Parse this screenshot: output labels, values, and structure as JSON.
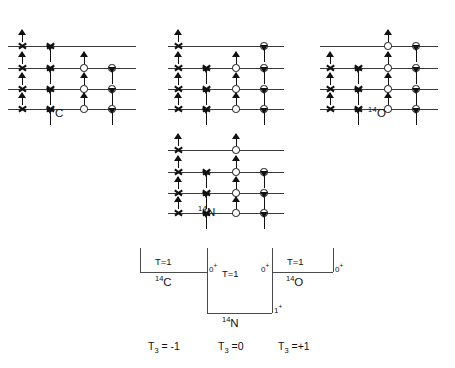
{
  "figure": {
    "top_cut_text": "",
    "caption": ""
  },
  "shell_diagrams": [
    {
      "id": "c14",
      "label_mass": "14",
      "label_symbol": "C",
      "x": 8,
      "y": 16,
      "width": 140,
      "line_width": 128,
      "label_x": 46,
      "label_y": 105,
      "levels": [
        30,
        52,
        73,
        93
      ],
      "columns": {
        "proton_up": 14,
        "proton_down": 42,
        "neutron_up": 76,
        "neutron_down": 104
      },
      "occupancy": [
        {
          "level": 0,
          "proton_up": true,
          "proton_down": true,
          "neutron_up": false,
          "neutron_down": false
        },
        {
          "level": 1,
          "proton_up": true,
          "proton_down": true,
          "neutron_up": true,
          "neutron_down": true
        },
        {
          "level": 2,
          "proton_up": true,
          "proton_down": true,
          "neutron_up": true,
          "neutron_down": true
        },
        {
          "level": 3,
          "proton_up": true,
          "proton_down": true,
          "neutron_up": true,
          "neutron_down": true
        }
      ]
    },
    {
      "id": "middle-top",
      "label_mass": "",
      "label_symbol": "",
      "x": 168,
      "y": 16,
      "width": 128,
      "line_width": 116,
      "label_x": 0,
      "label_y": 0,
      "levels": [
        30,
        52,
        73,
        93
      ],
      "columns": {
        "proton_up": 10,
        "proton_down": 38,
        "neutron_up": 68,
        "neutron_down": 96
      },
      "occupancy": [
        {
          "level": 0,
          "proton_up": true,
          "proton_down": false,
          "neutron_up": false,
          "neutron_down": true
        },
        {
          "level": 1,
          "proton_up": true,
          "proton_down": true,
          "neutron_up": true,
          "neutron_down": true
        },
        {
          "level": 2,
          "proton_up": true,
          "proton_down": true,
          "neutron_up": true,
          "neutron_down": true
        },
        {
          "level": 3,
          "proton_up": true,
          "proton_down": true,
          "neutron_up": true,
          "neutron_down": true
        }
      ]
    },
    {
      "id": "o14",
      "label_mass": "14",
      "label_symbol": "O",
      "x": 320,
      "y": 16,
      "width": 130,
      "line_width": 118,
      "label_x": 368,
      "label_y": 105,
      "levels": [
        30,
        52,
        73,
        93
      ],
      "columns": {
        "proton_up": 10,
        "proton_down": 38,
        "neutron_up": 68,
        "neutron_down": 96
      },
      "occupancy": [
        {
          "level": 0,
          "proton_up": false,
          "proton_down": false,
          "neutron_up": true,
          "neutron_down": true
        },
        {
          "level": 1,
          "proton_up": true,
          "proton_down": true,
          "neutron_up": true,
          "neutron_down": true
        },
        {
          "level": 2,
          "proton_up": true,
          "proton_down": true,
          "neutron_up": true,
          "neutron_down": true
        },
        {
          "level": 3,
          "proton_up": true,
          "proton_down": true,
          "neutron_up": true,
          "neutron_down": true
        }
      ]
    },
    {
      "id": "n14",
      "label_mass": "14",
      "label_symbol": "N",
      "x": 168,
      "y": 120,
      "width": 128,
      "line_width": 116,
      "label_x": 198,
      "label_y": 204,
      "levels": [
        30,
        52,
        73,
        93
      ],
      "columns": {
        "proton_up": 10,
        "proton_down": 38,
        "neutron_up": 68,
        "neutron_down": 96
      },
      "occupancy": [
        {
          "level": 0,
          "proton_up": true,
          "proton_down": false,
          "neutron_up": true,
          "neutron_down": false
        },
        {
          "level": 1,
          "proton_up": true,
          "proton_down": true,
          "neutron_up": true,
          "neutron_down": true
        },
        {
          "level": 2,
          "proton_up": true,
          "proton_down": true,
          "neutron_up": true,
          "neutron_down": true
        },
        {
          "level": 3,
          "proton_up": true,
          "proton_down": true,
          "neutron_up": true,
          "neutron_down": true
        }
      ]
    }
  ],
  "isospin_diagram": {
    "wells": [
      {
        "id": "c14",
        "label_mass": "14",
        "label_symbol": "C",
        "isospin": "T=1",
        "jp_value": "0",
        "jp_sign": "+",
        "left": 140,
        "right": 207,
        "top": 248,
        "bottom": 272,
        "label_x": 155,
        "label_y": 274,
        "isospin_x": 155,
        "isospin_y": 256,
        "jp_x": 209,
        "jp_y": 262
      },
      {
        "id": "n14",
        "label_mass": "14",
        "label_symbol": "N",
        "isospin": "T=1",
        "jp_value": "1",
        "jp_sign": "+",
        "left": 207,
        "right": 272,
        "top": 248,
        "bottom": 313,
        "label_x": 222,
        "label_y": 315,
        "isospin_x": 222,
        "isospin_y": 268,
        "jp_x": 274,
        "jp_y": 303
      },
      {
        "id": "o14",
        "label_mass": "14",
        "label_symbol": "O",
        "isospin": "T=1",
        "jp_value": "0",
        "jp_sign": "+",
        "left": 272,
        "right": 333,
        "top": 248,
        "bottom": 272,
        "label_x": 286,
        "label_y": 274,
        "isospin_x": 287,
        "isospin_y": 256,
        "jp_x": 335,
        "jp_y": 262
      }
    ],
    "middle_jp": {
      "value": "0",
      "sign": "+",
      "x": 261,
      "y": 262
    },
    "t3_labels": [
      {
        "symbol": "T",
        "sub": "3",
        "value": "= -1",
        "x": 148,
        "y": 340
      },
      {
        "symbol": "T",
        "sub": "3",
        "value": "=0",
        "x": 218,
        "y": 340
      },
      {
        "symbol": "T",
        "sub": "3",
        "value": "=+1",
        "x": 278,
        "y": 340
      }
    ]
  }
}
